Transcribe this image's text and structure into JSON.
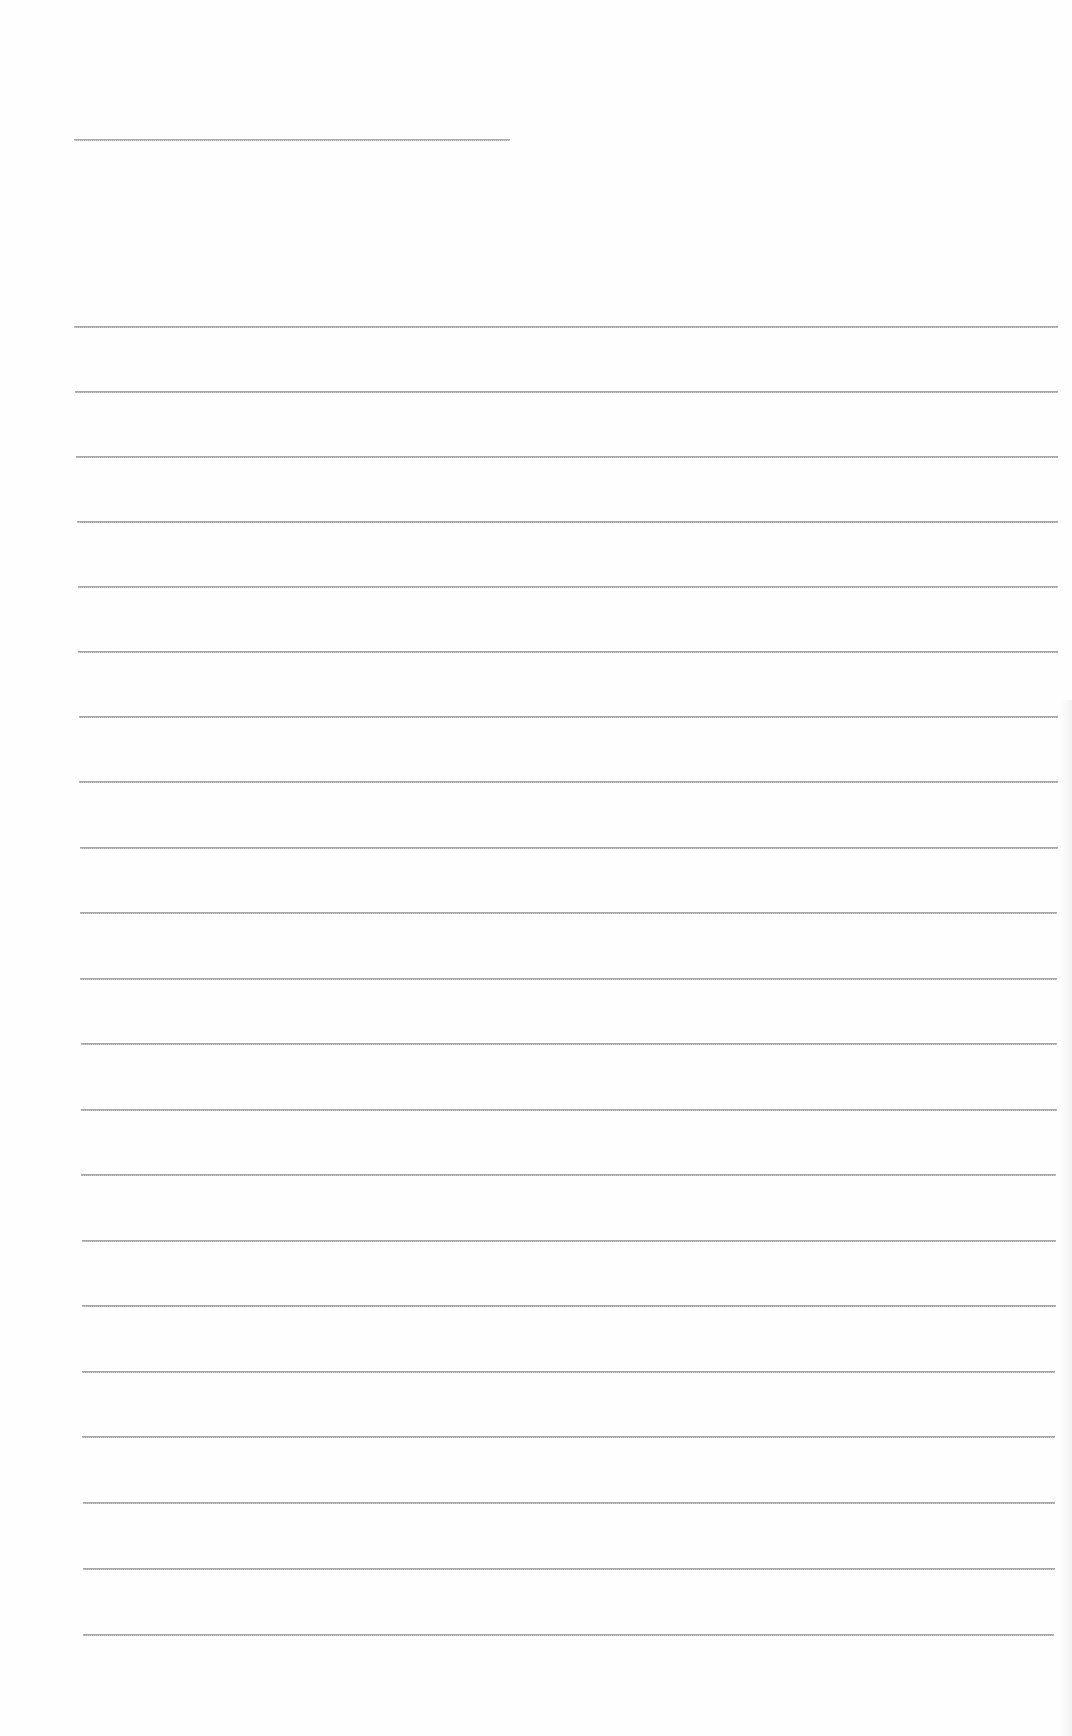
{
  "document": {
    "type": "blank lined sheet",
    "line_color": "#8a8a8a",
    "background": "#fefefe",
    "header_line": {
      "x1": 74,
      "x2": 510,
      "y": 139
    },
    "ruled_lines": [
      {
        "x1": 74,
        "x2": 1058,
        "y": 326
      },
      {
        "x1": 75,
        "x2": 1058,
        "y": 391
      },
      {
        "x1": 76,
        "x2": 1058,
        "y": 456
      },
      {
        "x1": 77,
        "x2": 1058,
        "y": 521
      },
      {
        "x1": 78,
        "x2": 1058,
        "y": 586
      },
      {
        "x1": 78,
        "x2": 1058,
        "y": 651
      },
      {
        "x1": 79,
        "x2": 1058,
        "y": 716
      },
      {
        "x1": 79,
        "x2": 1058,
        "y": 781
      },
      {
        "x1": 80,
        "x2": 1058,
        "y": 847
      },
      {
        "x1": 80,
        "x2": 1057,
        "y": 912
      },
      {
        "x1": 80,
        "x2": 1057,
        "y": 978
      },
      {
        "x1": 81,
        "x2": 1057,
        "y": 1043
      },
      {
        "x1": 81,
        "x2": 1057,
        "y": 1109
      },
      {
        "x1": 81,
        "x2": 1056,
        "y": 1174
      },
      {
        "x1": 82,
        "x2": 1056,
        "y": 1240
      },
      {
        "x1": 82,
        "x2": 1056,
        "y": 1305
      },
      {
        "x1": 82,
        "x2": 1055,
        "y": 1371
      },
      {
        "x1": 82,
        "x2": 1055,
        "y": 1436
      },
      {
        "x1": 83,
        "x2": 1055,
        "y": 1502
      },
      {
        "x1": 83,
        "x2": 1055,
        "y": 1568
      },
      {
        "x1": 83,
        "x2": 1054,
        "y": 1634
      }
    ]
  }
}
